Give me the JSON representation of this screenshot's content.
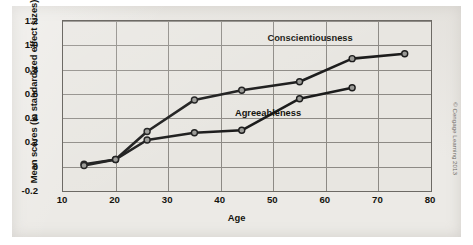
{
  "credit": "© Cengage Learning 2013",
  "chart_data": {
    "type": "line",
    "title": "",
    "xlabel": "Age",
    "ylabel": "Mean scores (in standardized effect sizes)",
    "xlim": [
      10,
      80
    ],
    "ylim": [
      -0.2,
      1.2
    ],
    "xticks": [
      10,
      20,
      30,
      40,
      50,
      60,
      70,
      80
    ],
    "yticks": [
      "-0.2",
      "0",
      "0.2",
      "0.4",
      "0.6",
      "0.8",
      "1.0",
      "1.2"
    ],
    "ytick_values": [
      -0.2,
      0,
      0.2,
      0.4,
      0.6,
      0.8,
      1.0,
      1.2
    ],
    "grid": true,
    "legend_position": "inline-annotation",
    "series": [
      {
        "name": "Conscientiousness",
        "color": "#1c1c1c",
        "label_x": 57,
        "label_y": 1.06,
        "points": [
          {
            "x": 14,
            "y": 0.02
          },
          {
            "x": 20,
            "y": 0.06
          },
          {
            "x": 26,
            "y": 0.29
          },
          {
            "x": 35,
            "y": 0.55
          },
          {
            "x": 44,
            "y": 0.63
          },
          {
            "x": 55,
            "y": 0.7
          },
          {
            "x": 65,
            "y": 0.89
          },
          {
            "x": 75,
            "y": 0.93
          }
        ]
      },
      {
        "name": "Agreeableness",
        "color": "#1c1c1c",
        "label_x": 49,
        "label_y": 0.44,
        "points": [
          {
            "x": 14,
            "y": 0.01
          },
          {
            "x": 20,
            "y": 0.06
          },
          {
            "x": 26,
            "y": 0.22
          },
          {
            "x": 35,
            "y": 0.28
          },
          {
            "x": 44,
            "y": 0.3
          },
          {
            "x": 55,
            "y": 0.56
          },
          {
            "x": 65,
            "y": 0.65
          }
        ]
      }
    ]
  }
}
